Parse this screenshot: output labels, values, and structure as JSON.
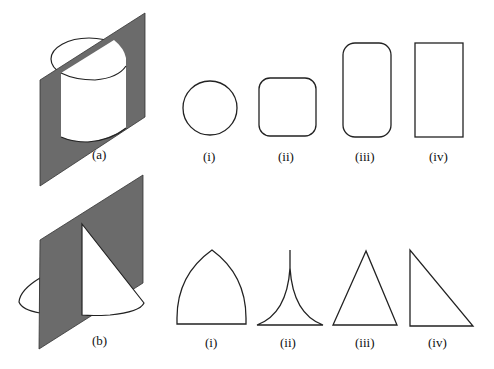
{
  "figure": {
    "colors": {
      "plane_fill": "#6b6b6b",
      "stroke": "#222222",
      "background": "#ffffff"
    },
    "row_a": {
      "solid_label": "(a)",
      "solid": "cylinder cut by an inclined plane",
      "options": [
        {
          "label": "(i)",
          "shape": "circle"
        },
        {
          "label": "(ii)",
          "shape": "rounded-square"
        },
        {
          "label": "(iii)",
          "shape": "rounded-rectangle"
        },
        {
          "label": "(iv)",
          "shape": "rectangle"
        }
      ]
    },
    "row_b": {
      "solid_label": "(b)",
      "solid": "cone cut by a vertical plane through the apex",
      "options": [
        {
          "label": "(i)",
          "shape": "curved-arch"
        },
        {
          "label": "(ii)",
          "shape": "concave-cusp"
        },
        {
          "label": "(iii)",
          "shape": "isosceles-triangle"
        },
        {
          "label": "(iv)",
          "shape": "right-triangle"
        }
      ]
    }
  }
}
